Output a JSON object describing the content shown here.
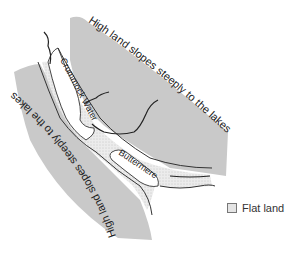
{
  "map": {
    "title": "Crummock Water and Buttermere valley",
    "labels": {
      "upper_slope": "High land slopes steeply to the lakes",
      "lower_slope": "High land slopes steeply to the lakes",
      "lake_1": "Crummock Water",
      "lake_2": "Buttermere"
    },
    "colors": {
      "high_land": "#c8c8c8",
      "flat_land": "#e6e6e6",
      "lake": "#ffffff",
      "outline": "#333333"
    }
  },
  "legend": {
    "items": [
      {
        "label": "Flat land",
        "swatch": "flat-land-dotted"
      }
    ]
  }
}
